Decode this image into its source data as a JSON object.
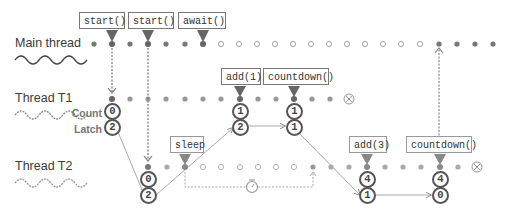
{
  "threads": [
    {
      "label": "Main thread",
      "y": 44
    },
    {
      "label": "Thread T1",
      "y": 99
    },
    {
      "label": "Thread T2",
      "y": 167
    }
  ],
  "counter_labels": {
    "count": "Count",
    "latch": "Latch"
  },
  "callouts": {
    "main_start_t1": "start()",
    "main_start_t2": "start()",
    "main_await": "await()",
    "t1_add": "add(1)",
    "t1_countdown": "countdown()",
    "t2_sleep": "sleep",
    "t2_add": "add(3)",
    "t2_countdown": "countdown()"
  },
  "states": {
    "t1_start": {
      "count": "0",
      "latch": "2"
    },
    "t2_start": {
      "count": "0",
      "latch": "2"
    },
    "t1_add": {
      "count": "1",
      "latch": "2"
    },
    "t1_countdown": {
      "count": "1",
      "latch": "1"
    },
    "t2_add": {
      "count": "4",
      "latch": "1"
    },
    "t2_countdown": {
      "count": "4",
      "latch": "0"
    }
  },
  "colors": {
    "dot": "#888888",
    "line": "#999999",
    "marker": "#666666",
    "border": "#555555"
  }
}
